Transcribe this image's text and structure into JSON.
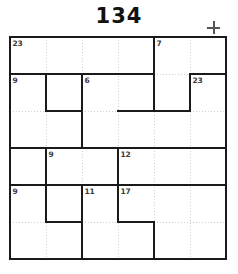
{
  "puzzle": {
    "title": "134",
    "type": "killer-sudoku-cage-grid",
    "rows": 6,
    "columns": 6,
    "colors": {
      "cage_border": "#1a1a1a",
      "cell_line": "#cfcfcf",
      "clue_text": "#3b3b3b",
      "title_text": "#111111",
      "plus_icon": "#555555",
      "background": "#ffffff"
    }
  },
  "toolbar": {
    "add_icon": "plus-icon"
  },
  "clues": [
    {
      "label": "23",
      "row": 1,
      "col": 1
    },
    {
      "label": "7",
      "row": 1,
      "col": 5
    },
    {
      "label": "9",
      "row": 2,
      "col": 1
    },
    {
      "label": "6",
      "row": 2,
      "col": 3
    },
    {
      "label": "23",
      "row": 2,
      "col": 6
    },
    {
      "label": "9",
      "row": 4,
      "col": 2
    },
    {
      "label": "12",
      "row": 4,
      "col": 4
    },
    {
      "label": "9",
      "row": 5,
      "col": 1
    },
    {
      "label": "11",
      "row": 5,
      "col": 3
    },
    {
      "label": "17",
      "row": 5,
      "col": 4
    }
  ],
  "cells": [
    {
      "row": 1,
      "col": 1,
      "value": ""
    },
    {
      "row": 1,
      "col": 2,
      "value": ""
    },
    {
      "row": 1,
      "col": 3,
      "value": ""
    },
    {
      "row": 1,
      "col": 4,
      "value": ""
    },
    {
      "row": 1,
      "col": 5,
      "value": ""
    },
    {
      "row": 1,
      "col": 6,
      "value": ""
    },
    {
      "row": 2,
      "col": 1,
      "value": ""
    },
    {
      "row": 2,
      "col": 2,
      "value": ""
    },
    {
      "row": 2,
      "col": 3,
      "value": ""
    },
    {
      "row": 2,
      "col": 4,
      "value": ""
    },
    {
      "row": 2,
      "col": 5,
      "value": ""
    },
    {
      "row": 2,
      "col": 6,
      "value": ""
    },
    {
      "row": 3,
      "col": 1,
      "value": ""
    },
    {
      "row": 3,
      "col": 2,
      "value": ""
    },
    {
      "row": 3,
      "col": 3,
      "value": ""
    },
    {
      "row": 3,
      "col": 4,
      "value": ""
    },
    {
      "row": 3,
      "col": 5,
      "value": ""
    },
    {
      "row": 3,
      "col": 6,
      "value": ""
    },
    {
      "row": 4,
      "col": 1,
      "value": ""
    },
    {
      "row": 4,
      "col": 2,
      "value": ""
    },
    {
      "row": 4,
      "col": 3,
      "value": ""
    },
    {
      "row": 4,
      "col": 4,
      "value": ""
    },
    {
      "row": 4,
      "col": 5,
      "value": ""
    },
    {
      "row": 4,
      "col": 6,
      "value": ""
    },
    {
      "row": 5,
      "col": 1,
      "value": ""
    },
    {
      "row": 5,
      "col": 2,
      "value": ""
    },
    {
      "row": 5,
      "col": 3,
      "value": ""
    },
    {
      "row": 5,
      "col": 4,
      "value": ""
    },
    {
      "row": 5,
      "col": 5,
      "value": ""
    },
    {
      "row": 5,
      "col": 6,
      "value": ""
    },
    {
      "row": 6,
      "col": 1,
      "value": ""
    },
    {
      "row": 6,
      "col": 2,
      "value": ""
    },
    {
      "row": 6,
      "col": 3,
      "value": ""
    },
    {
      "row": 6,
      "col": 4,
      "value": ""
    },
    {
      "row": 6,
      "col": 5,
      "value": ""
    },
    {
      "row": 6,
      "col": 6,
      "value": ""
    }
  ],
  "cage_edges": {
    "horizontal": [
      {
        "row": 0,
        "col_start": 0,
        "col_end": 6
      },
      {
        "row": 1,
        "col_start": 0,
        "col_end": 4
      },
      {
        "row": 1,
        "col_start": 5,
        "col_end": 6
      },
      {
        "row": 2,
        "col_start": 1,
        "col_end": 2
      },
      {
        "row": 2,
        "col_start": 3,
        "col_end": 5
      },
      {
        "row": 3,
        "col_start": 0,
        "col_end": 6
      },
      {
        "row": 4,
        "col_start": 0,
        "col_end": 6
      },
      {
        "row": 5,
        "col_start": 1,
        "col_end": 2
      },
      {
        "row": 5,
        "col_start": 3,
        "col_end": 4
      },
      {
        "row": 6,
        "col_start": 0,
        "col_end": 6
      }
    ],
    "vertical": [
      {
        "col": 0,
        "row_start": 0,
        "row_end": 6
      },
      {
        "col": 1,
        "row_start": 1,
        "row_end": 2
      },
      {
        "col": 1,
        "row_start": 3,
        "row_end": 5
      },
      {
        "col": 2,
        "row_start": 1,
        "row_end": 3
      },
      {
        "col": 2,
        "row_start": 4,
        "row_end": 6
      },
      {
        "col": 3,
        "row_start": 3,
        "row_end": 5
      },
      {
        "col": 4,
        "row_start": 0,
        "row_end": 2
      },
      {
        "col": 4,
        "row_start": 5,
        "row_end": 6
      },
      {
        "col": 5,
        "row_start": 1,
        "row_end": 2
      },
      {
        "col": 6,
        "row_start": 0,
        "row_end": 6
      }
    ]
  }
}
